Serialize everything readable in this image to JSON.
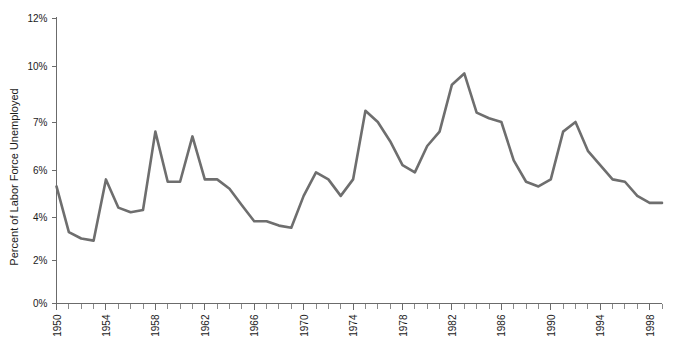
{
  "chart_data": {
    "type": "line",
    "title": "",
    "subtitle": "",
    "xlabel": "",
    "ylabel": "Percent of Labor Force Unemployed",
    "grid": false,
    "legend": "none",
    "xlim": [
      1950,
      1999
    ],
    "ylim": [
      0,
      12
    ],
    "y_tick_labels": [
      "0%",
      "2%",
      "4%",
      "6%",
      "7%",
      "10%",
      "12%"
    ],
    "y_tick_values": [
      0,
      2,
      4,
      6,
      7,
      10,
      12
    ],
    "x_tick_labels": [
      "1950",
      "1954",
      "1958",
      "1962",
      "1966",
      "1970",
      "1974",
      "1978",
      "1982",
      "1986",
      "1990",
      "1994",
      "1998"
    ],
    "x_tick_values": [
      1950,
      1954,
      1958,
      1962,
      1966,
      1970,
      1974,
      1978,
      1982,
      1986,
      1990,
      1994,
      1998
    ],
    "x_minor_tick_step": 1,
    "series": [
      {
        "name": "Percent of Labor Force Unemployed",
        "color": "#6e6e6e",
        "x": [
          1950,
          1951,
          1952,
          1953,
          1954,
          1955,
          1956,
          1957,
          1958,
          1959,
          1960,
          1961,
          1962,
          1963,
          1964,
          1965,
          1966,
          1967,
          1968,
          1969,
          1970,
          1971,
          1972,
          1973,
          1974,
          1975,
          1976,
          1977,
          1978,
          1979,
          1980,
          1981,
          1982,
          1983,
          1984,
          1985,
          1986,
          1987,
          1988,
          1989,
          1990,
          1991,
          1992,
          1993,
          1994,
          1995,
          1996,
          1997,
          1998,
          1999
        ],
        "values": [
          5.3,
          3.3,
          3.0,
          2.9,
          5.6,
          4.4,
          4.2,
          4.3,
          6.8,
          5.5,
          5.5,
          6.7,
          5.6,
          5.6,
          5.2,
          4.5,
          3.8,
          3.8,
          3.6,
          3.5,
          4.9,
          5.9,
          5.6,
          4.9,
          5.6,
          7.6,
          7.0,
          6.6,
          6.1,
          5.9,
          6.5,
          6.8,
          9.0,
          9.6,
          7.5,
          7.2,
          7.0,
          6.2,
          5.5,
          5.3,
          5.6,
          6.8,
          7.0,
          6.4,
          6.1,
          5.6,
          5.5,
          4.9,
          4.6,
          4.6
        ],
        "note": "U.S. civilian unemployment rate, annual, 1950-1999"
      }
    ]
  },
  "plot": {
    "y_axis_title": "Percent of Labor Force Unemployed"
  }
}
